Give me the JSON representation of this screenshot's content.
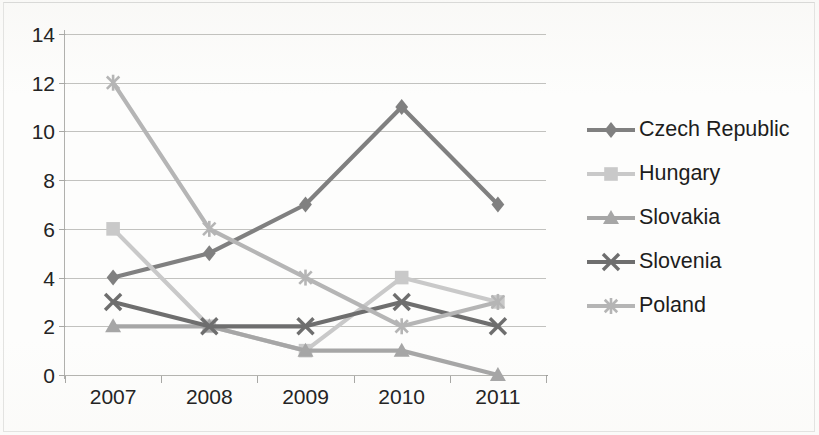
{
  "chart_data": {
    "type": "line",
    "title": "",
    "xlabel": "",
    "ylabel": "",
    "categories": [
      "2007",
      "2008",
      "2009",
      "2010",
      "2011"
    ],
    "ylim": [
      0,
      14
    ],
    "ytick_step": 2,
    "yticks": [
      "0",
      "2",
      "4",
      "6",
      "8",
      "10",
      "12",
      "14"
    ],
    "grid": true,
    "legend_position": "right",
    "series": [
      {
        "name": "Czech Republic",
        "values": [
          4,
          5,
          7,
          11,
          7
        ],
        "color": "#808080",
        "marker": "diamond"
      },
      {
        "name": "Hungary",
        "values": [
          6,
          2,
          1,
          4,
          3
        ],
        "color": "#c9c9c9",
        "marker": "square"
      },
      {
        "name": "Slovakia",
        "values": [
          2,
          2,
          1,
          1,
          0
        ],
        "color": "#a6a6a6",
        "marker": "triangle"
      },
      {
        "name": "Slovenia",
        "values": [
          3,
          2,
          2,
          3,
          2
        ],
        "color": "#6e6e6e",
        "marker": "x"
      },
      {
        "name": "Poland",
        "values": [
          12,
          6,
          4,
          2,
          3
        ],
        "color": "#b5b5b5",
        "marker": "star"
      }
    ]
  },
  "legend": {
    "items": [
      {
        "label": "Czech Republic"
      },
      {
        "label": "Hungary"
      },
      {
        "label": "Slovakia"
      },
      {
        "label": "Slovenia"
      },
      {
        "label": "Poland"
      }
    ]
  },
  "axes": {
    "y_ticks": [
      "14",
      "12",
      "10",
      "8",
      "6",
      "4",
      "2",
      "0"
    ],
    "x_ticks": [
      "2007",
      "2008",
      "2009",
      "2010",
      "2011"
    ]
  }
}
